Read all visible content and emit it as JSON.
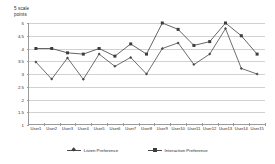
{
  "chart_data": {
    "type": "line",
    "title": "",
    "ylabel": "5 scale\npoints",
    "xlabel": "",
    "ylim": [
      1,
      5
    ],
    "yticks": [
      "5",
      "4.5",
      "4",
      "3.5",
      "3",
      "2.5",
      "2",
      "1.5",
      "1"
    ],
    "ytick_values": [
      5,
      4.5,
      4,
      3.5,
      3,
      2.5,
      2,
      1.5,
      1
    ],
    "grid": true,
    "legend_position": "bottom",
    "categories": [
      "User1",
      "User2",
      "User3",
      "User4",
      "User5",
      "User6",
      "User7",
      "User8",
      "User9",
      "User10",
      "User11",
      "User12",
      "User13",
      "User14",
      "User15"
    ],
    "series": [
      {
        "name": "Listen Preference",
        "marker": "diamond",
        "color": "#4a4a4a",
        "values": [
          3.47,
          2.8,
          3.63,
          2.79,
          3.78,
          3.3,
          3.65,
          3.0,
          4.0,
          4.22,
          3.37,
          3.78,
          4.78,
          3.22,
          3.0
        ]
      },
      {
        "name": "Interaction Preference",
        "marker": "square",
        "color": "#3d3d3d",
        "values": [
          4.0,
          4.0,
          3.83,
          3.78,
          4.0,
          3.7,
          4.18,
          3.78,
          5.0,
          4.75,
          4.12,
          4.27,
          5.0,
          4.5,
          3.78
        ]
      }
    ]
  },
  "legend": {
    "items": [
      {
        "label": "Listen Preference",
        "marker": "diamond"
      },
      {
        "label": "Interaction Preference",
        "marker": "square"
      }
    ]
  }
}
